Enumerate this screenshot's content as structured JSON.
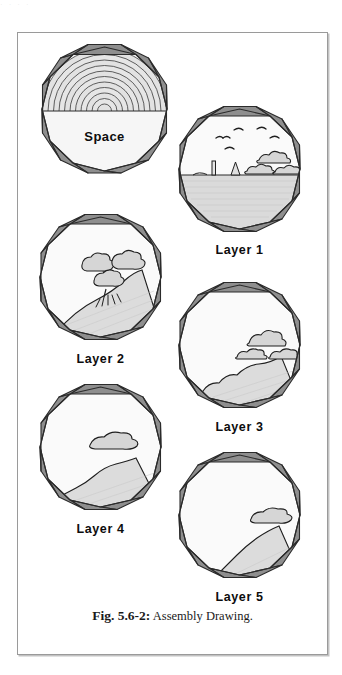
{
  "figure": {
    "caption_label": "Fig. 5.6-2:",
    "caption_text": " Assembly Drawing.",
    "ghost_text": "·                    ·                         ·                    ·"
  },
  "colors": {
    "segment_fill": "#8e8e8e",
    "segment_stroke": "#2b2b2b",
    "interior_fill": "#f5f5f5",
    "ground_fill": "#d8d8d8",
    "ring_stroke": "#3a3a3a",
    "frame_border": "#9a9a9a",
    "text": "#0d0d0d",
    "cloud_fill": "#d2d2d2"
  },
  "modules": [
    {
      "id": "space",
      "label": "Space",
      "label_position": "inside",
      "description": "Decagonal shell module with concentric rings filling the upper half and an open lower half containing the word Space",
      "rings": 11,
      "has_ground": false,
      "has_clouds": false,
      "has_birds": false,
      "has_trees": false
    },
    {
      "id": "layer-1",
      "label": "Layer 1",
      "label_position": "below",
      "description": "Decagonal module with flat ground plane at mid height, birds, three clouds, an obelisk and a small tent-like structure",
      "rings": 0,
      "has_ground": true,
      "ground_style": "flat",
      "has_clouds": true,
      "cloud_count": 3,
      "has_birds": true,
      "bird_count": 4,
      "has_trees": false
    },
    {
      "id": "layer-2",
      "label": "Layer 2",
      "label_position": "below",
      "description": "Decagonal module with a sloping terrain rising to the right, a cluster of three trees and grass tufts",
      "rings": 0,
      "has_ground": true,
      "ground_style": "slope-right",
      "has_clouds": false,
      "has_birds": false,
      "has_trees": true,
      "tree_count": 3
    },
    {
      "id": "layer-3",
      "label": "Layer 3",
      "label_position": "below",
      "description": "Decagonal module with undulating terrain in the lower right and a group of three rocky mounds",
      "rings": 0,
      "has_ground": true,
      "ground_style": "rolling",
      "has_clouds": true,
      "cloud_count": 3,
      "has_birds": false,
      "has_trees": false
    },
    {
      "id": "layer-4",
      "label": "Layer 4",
      "label_position": "below",
      "description": "Decagonal module with a lower right terrain wedge and one isolated rocky mound floating above it",
      "rings": 0,
      "has_ground": true,
      "ground_style": "wedge",
      "has_clouds": true,
      "cloud_count": 1,
      "has_birds": false,
      "has_trees": false
    },
    {
      "id": "layer-5",
      "label": "Layer 5",
      "label_position": "below",
      "description": "Decagonal module with a small terrain wedge in the lower right corner and a single rocky mound",
      "rings": 0,
      "has_ground": true,
      "ground_style": "wedge-small",
      "has_clouds": true,
      "cloud_count": 1,
      "has_birds": false,
      "has_trees": false
    }
  ]
}
